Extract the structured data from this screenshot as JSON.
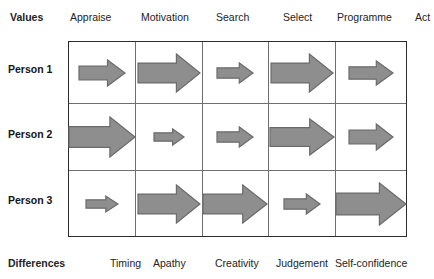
{
  "header": {
    "title_label": "Values",
    "columns": [
      "Appraise",
      "Motivation",
      "Search",
      "Select",
      "Programme",
      "Act"
    ],
    "positions": [
      10,
      70,
      141,
      216,
      283,
      337,
      415
    ]
  },
  "footer": {
    "title_label": "Differences",
    "columns": [
      "Timing",
      "Apathy",
      "Creativity",
      "Judgement",
      "Self-confidence"
    ],
    "positions": [
      8,
      110,
      153,
      215,
      276,
      335
    ]
  },
  "rows": {
    "labels": [
      "Person 1",
      "Person 2",
      "Person 3"
    ],
    "label_tops": [
      22,
      87,
      153
    ]
  },
  "matrix": {
    "column_keys": [
      "Appraise",
      "Motivation",
      "Search",
      "Select",
      "Programme"
    ],
    "cells": [
      [
        {
          "person": "Person 1",
          "column": "Appraise",
          "magnitude": "medium",
          "arrow_width": 46,
          "arrow_height": 26
        },
        {
          "person": "Person 1",
          "column": "Motivation",
          "magnitude": "large",
          "arrow_width": 62,
          "arrow_height": 38
        },
        {
          "person": "Person 1",
          "column": "Search",
          "magnitude": "small",
          "arrow_width": 36,
          "arrow_height": 20
        },
        {
          "person": "Person 1",
          "column": "Select",
          "magnitude": "large",
          "arrow_width": 62,
          "arrow_height": 38
        },
        {
          "person": "Person 1",
          "column": "Programme",
          "magnitude": "medium",
          "arrow_width": 44,
          "arrow_height": 24
        }
      ],
      [
        {
          "person": "Person 2",
          "column": "Appraise",
          "magnitude": "large",
          "arrow_width": 66,
          "arrow_height": 40
        },
        {
          "person": "Person 2",
          "column": "Motivation",
          "magnitude": "very-small",
          "arrow_width": 30,
          "arrow_height": 16
        },
        {
          "person": "Person 2",
          "column": "Search",
          "magnitude": "small",
          "arrow_width": 36,
          "arrow_height": 20
        },
        {
          "person": "Person 2",
          "column": "Select",
          "magnitude": "large",
          "arrow_width": 64,
          "arrow_height": 36
        },
        {
          "person": "Person 2",
          "column": "Programme",
          "magnitude": "medium",
          "arrow_width": 44,
          "arrow_height": 26
        }
      ],
      [
        {
          "person": "Person 3",
          "column": "Appraise",
          "magnitude": "very-small",
          "arrow_width": 32,
          "arrow_height": 16
        },
        {
          "person": "Person 3",
          "column": "Motivation",
          "magnitude": "large",
          "arrow_width": 62,
          "arrow_height": 38
        },
        {
          "person": "Person 3",
          "column": "Search",
          "magnitude": "large",
          "arrow_width": 64,
          "arrow_height": 38
        },
        {
          "person": "Person 3",
          "column": "Select",
          "magnitude": "small",
          "arrow_width": 36,
          "arrow_height": 20
        },
        {
          "person": "Person 3",
          "column": "Programme",
          "magnitude": "extra-large",
          "arrow_width": 70,
          "arrow_height": 42
        }
      ]
    ]
  },
  "colors": {
    "arrow_fill": "#8e8e8e",
    "arrow_stroke": "#6b6b6b",
    "outer_border": "#2b2b2b",
    "inner_border": "#6f6f6f",
    "text": "#1a1a1a",
    "background": "#ffffff"
  }
}
